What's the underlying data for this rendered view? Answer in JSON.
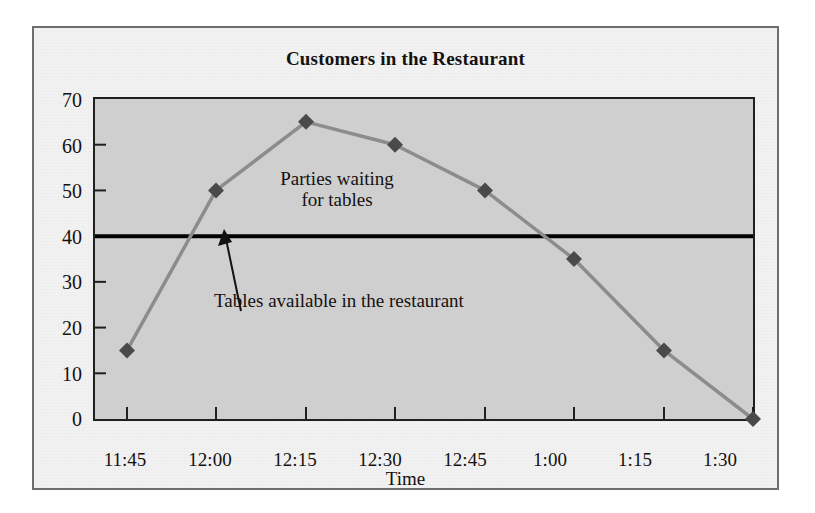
{
  "chart_data": {
    "type": "line",
    "title": "Customers in the Restaurant",
    "xlabel": "Time",
    "ylabel": "",
    "categories": [
      "11:45",
      "12:00",
      "12:15",
      "12:30",
      "12:45",
      "1:00",
      "1:15",
      "1:30"
    ],
    "series": [
      {
        "name": "Parties waiting for tables",
        "values": [
          15,
          50,
          65,
          60,
          50,
          35,
          15,
          0
        ],
        "color": "#8c8c8c",
        "marker": "diamond",
        "marker_color": "#4a4a4a"
      }
    ],
    "reference_lines": [
      {
        "name": "Tables available in the restaurant",
        "value": 40,
        "color": "#000000",
        "orientation": "horizontal"
      }
    ],
    "ylim": [
      0,
      70
    ],
    "yticks": [
      0,
      10,
      20,
      30,
      40,
      50,
      60,
      70
    ],
    "ytick_labels": [
      "0",
      "10",
      "20",
      "30",
      "40",
      "50",
      "60",
      "70"
    ],
    "grid": false,
    "legend": "none",
    "annotations": [
      {
        "id": "series-label",
        "text": "Parties waiting\nfor tables",
        "at_x": "12:15",
        "at_y": 52
      },
      {
        "id": "threshold-label",
        "text": "Tables available in the restaurant",
        "at_x": "12:00",
        "at_y": 26,
        "arrow_to_y": 40
      }
    ],
    "plot_background": "#cfcfcf",
    "figure_background": "#f2f2f2",
    "frame_color": "#6e6e6e"
  }
}
